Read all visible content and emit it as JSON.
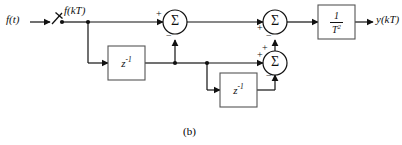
{
  "figure": {
    "caption": "(b)",
    "type": "block-diagram",
    "domain": "discrete-time control system signal flow graph"
  },
  "signals": {
    "input_continuous": "f(t)",
    "input_sampled": "f(kT)",
    "output": "y(kT)"
  },
  "blocks": {
    "delay1_label": "z",
    "delay1_exp": "-1",
    "delay2_label": "z",
    "delay2_exp": "-1",
    "gain_numerator": "1",
    "gain_denominator": "T",
    "gain_denominator_exp": "2"
  },
  "summers": {
    "sigma_glyph": "Σ",
    "summer1": {
      "name": "summer-1",
      "left_sign": "+",
      "bottom_sign": "−"
    },
    "summer2": {
      "name": "summer-2",
      "left_sign": "+",
      "bottom_sign": "−"
    },
    "summer3": {
      "name": "summer-3",
      "left_sign": "+",
      "top_sign": "+",
      "bottom_sign": "−"
    }
  },
  "components": {
    "sampler": "sampler-switch",
    "node_input": "junction-node",
    "node_delay1_out": "junction-node",
    "node_branch": "junction-node"
  },
  "colors": {
    "line": "#111111",
    "box_border": "#555555",
    "background": "#ffffff"
  }
}
